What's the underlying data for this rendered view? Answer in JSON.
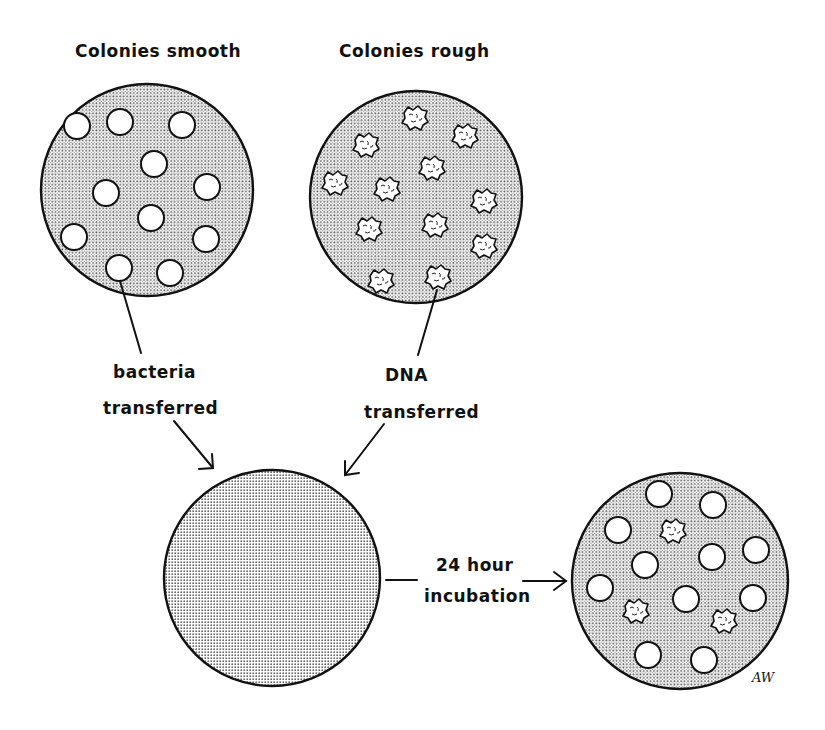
{
  "labels": {
    "plate_smooth_title": "Colonies smooth",
    "plate_rough_title": "Colonies rough",
    "bacteria_line1": "bacteria",
    "bacteria_line2": "transferred",
    "dna_line1": "DNA",
    "dna_line2": "transferred",
    "incubation_line1": "24 hour",
    "incubation_line2": "incubation",
    "signature": "AW"
  },
  "plates": [
    {
      "name": "smooth-colonies-plate",
      "cx": 147,
      "cy": 190,
      "r": 106,
      "colonies": "smooth",
      "count": 11
    },
    {
      "name": "rough-colonies-plate",
      "cx": 416,
      "cy": 197,
      "r": 106,
      "colonies": "rough",
      "count": 11
    },
    {
      "name": "mixed-culture-plate",
      "cx": 272,
      "cy": 578,
      "r": 108,
      "colonies": "none",
      "count": 0
    },
    {
      "name": "result-plate",
      "cx": 680,
      "cy": 581,
      "r": 108,
      "colonies": "mostly smooth, few rough",
      "count": 14
    }
  ],
  "colors": {
    "ink": "#111111",
    "background": "#ffffff",
    "stipple": "#555555"
  }
}
